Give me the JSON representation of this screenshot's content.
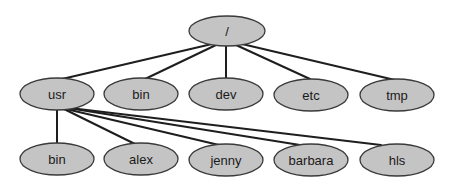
{
  "diagram": {
    "type": "tree",
    "title": "",
    "colors": {
      "node_fill": "#c4c4c4",
      "node_stroke": "#3a3a3a",
      "edge": "#1e1e1e",
      "background": "#ffffff"
    },
    "root": {
      "id": "root",
      "label": "/"
    },
    "level1": [
      {
        "id": "usr",
        "label": "usr"
      },
      {
        "id": "bin",
        "label": "bin"
      },
      {
        "id": "dev",
        "label": "dev"
      },
      {
        "id": "etc",
        "label": "etc"
      },
      {
        "id": "tmp",
        "label": "tmp"
      }
    ],
    "level2": [
      {
        "id": "usr-bin",
        "label": "bin",
        "parent": "usr"
      },
      {
        "id": "alex",
        "label": "alex",
        "parent": "usr"
      },
      {
        "id": "jenny",
        "label": "jenny",
        "parent": "usr"
      },
      {
        "id": "barbara",
        "label": "barbara",
        "parent": "usr"
      },
      {
        "id": "hls",
        "label": "hls",
        "parent": "usr"
      }
    ],
    "edges": [
      [
        "/",
        "usr"
      ],
      [
        "/",
        "bin"
      ],
      [
        "/",
        "dev"
      ],
      [
        "/",
        "etc"
      ],
      [
        "/",
        "tmp"
      ],
      [
        "usr",
        "bin"
      ],
      [
        "usr",
        "alex"
      ],
      [
        "usr",
        "jenny"
      ],
      [
        "usr",
        "barbara"
      ],
      [
        "usr",
        "hls"
      ]
    ]
  }
}
